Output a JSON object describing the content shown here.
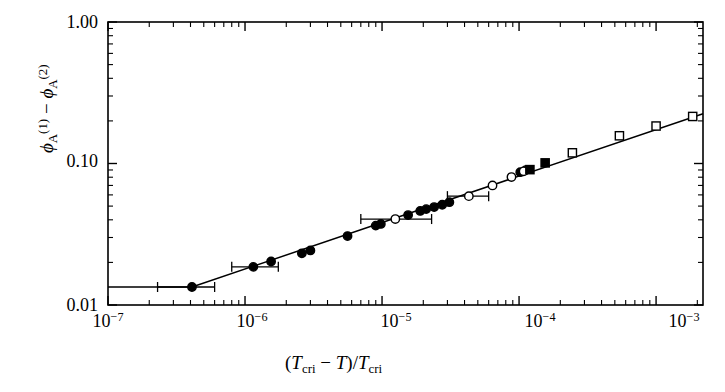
{
  "chart_data": {
    "type": "scatter",
    "title": "",
    "xlabel": "(T_cri - T)/T_cri",
    "ylabel": "phi_A^(1) - phi_A^(2)",
    "xscale": "log",
    "yscale": "log",
    "xlim": [
      1e-07,
      0.0022
    ],
    "ylim": [
      0.01,
      1.0
    ],
    "grid": false,
    "legend": "none",
    "xtick_labels": [
      "10",
      "10",
      "10",
      "10",
      "10"
    ],
    "xtick_exponents": [
      "-7",
      "-6",
      "-5",
      "-4",
      "-3"
    ],
    "xtick_values": [
      1e-07,
      1e-06,
      1e-05,
      0.0001,
      0.001
    ],
    "ytick_labels": [
      "1.00",
      "0.10",
      "0.01"
    ],
    "ytick_values": [
      1.0,
      0.1,
      0.01
    ],
    "fit_line": {
      "description": "power-law fit, flat plateau below 4e-7",
      "points": [
        [
          1e-07,
          0.0134
        ],
        [
          4.1e-07,
          0.0134
        ],
        [
          0.0022,
          0.225
        ]
      ]
    },
    "series": [
      {
        "name": "filled-circle",
        "marker": "filled-circle",
        "points": [
          {
            "x": 4.1e-07,
            "y": 0.0134,
            "xerr_lo": 2.3e-07,
            "xerr_hi": 6e-07
          },
          {
            "x": 1.15e-06,
            "y": 0.0186,
            "xerr_lo": 8e-07,
            "xerr_hi": 1.75e-06
          },
          {
            "x": 1.55e-06,
            "y": 0.0203
          },
          {
            "x": 2.6e-06,
            "y": 0.0232
          },
          {
            "x": 3e-06,
            "y": 0.0243
          },
          {
            "x": 5.6e-06,
            "y": 0.0307
          },
          {
            "x": 9e-06,
            "y": 0.0364
          },
          {
            "x": 9.8e-06,
            "y": 0.0374
          },
          {
            "x": 1.55e-05,
            "y": 0.0432
          },
          {
            "x": 1.9e-05,
            "y": 0.0462
          },
          {
            "x": 2.1e-05,
            "y": 0.0476
          },
          {
            "x": 2.4e-05,
            "y": 0.0492
          },
          {
            "x": 2.75e-05,
            "y": 0.0511
          },
          {
            "x": 3.1e-05,
            "y": 0.0533
          },
          {
            "x": 0.000102,
            "y": 0.0868
          },
          {
            "x": 0.000112,
            "y": 0.0898
          }
        ]
      },
      {
        "name": "open-circle",
        "marker": "open-circle",
        "points": [
          {
            "x": 1.25e-05,
            "y": 0.0405,
            "xerr_lo": 7e-06,
            "xerr_hi": 2.3e-05
          },
          {
            "x": 4.3e-05,
            "y": 0.0588,
            "xerr_lo": 3e-05,
            "xerr_hi": 6e-05
          },
          {
            "x": 6.4e-05,
            "y": 0.07
          },
          {
            "x": 8.8e-05,
            "y": 0.0802
          },
          {
            "x": 0.000108,
            "y": 0.088
          }
        ]
      },
      {
        "name": "filled-square",
        "marker": "filled-square",
        "points": [
          {
            "x": 0.00012,
            "y": 0.0905
          },
          {
            "x": 0.000155,
            "y": 0.101
          }
        ]
      },
      {
        "name": "open-square",
        "marker": "open-square",
        "points": [
          {
            "x": 0.000245,
            "y": 0.119
          },
          {
            "x": 0.00054,
            "y": 0.157
          },
          {
            "x": 0.001,
            "y": 0.184
          },
          {
            "x": 0.00185,
            "y": 0.215
          }
        ]
      }
    ]
  },
  "axis": {
    "y_label_parts": {
      "phi1": "ϕ",
      "sub1": "A",
      "sup1": "(1)",
      "minus": "−",
      "phi2": "ϕ",
      "sub2": "A",
      "sup2": "(2)"
    },
    "x_label_parts": {
      "open": "(",
      "t1": "T",
      "sub1": "cri",
      "minus": "−",
      "t2": "T",
      "close": ")/",
      "t3": "T",
      "sub2": "cri"
    },
    "ytick_0": "1.00",
    "ytick_1": "0.10",
    "ytick_2": "0.01",
    "xtick_0_mantissa": "10",
    "xtick_0_exp": "−7",
    "xtick_1_mantissa": "10",
    "xtick_1_exp": "−6",
    "xtick_2_mantissa": "10",
    "xtick_2_exp": "−5",
    "xtick_3_mantissa": "10",
    "xtick_3_exp": "−4",
    "xtick_4_mantissa": "10",
    "xtick_4_exp": "−3"
  },
  "colors": {
    "axis": "#000000",
    "line": "#000000",
    "marker_fill": "#000000",
    "marker_open": "#ffffff",
    "background": "#ffffff"
  }
}
